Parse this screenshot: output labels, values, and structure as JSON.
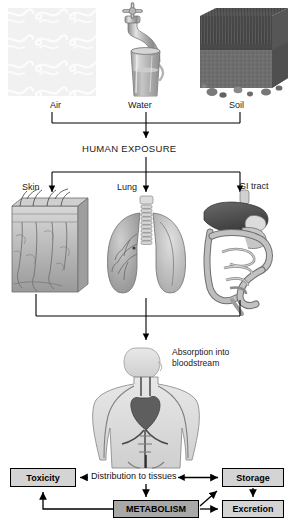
{
  "diagram": {
    "sources": [
      {
        "id": "air",
        "label": "Air",
        "icon": "air-swirls-icon"
      },
      {
        "id": "water",
        "label": "Water",
        "icon": "faucet-glass-icon"
      },
      {
        "id": "soil",
        "label": "Soil",
        "icon": "grass-soil-block-icon"
      }
    ],
    "exposure_node": "HUMAN EXPOSURE",
    "routes": [
      {
        "id": "skin",
        "label": "Skin",
        "icon": "skin-cross-section-icon"
      },
      {
        "id": "lung",
        "label": "Lung",
        "icon": "lungs-icon"
      },
      {
        "id": "gi",
        "label": "GI tract",
        "icon": "gi-tract-icon"
      }
    ],
    "absorption": {
      "label": "Absorption into bloodstream",
      "icon": "human-torso-circulatory-icon"
    },
    "fate": {
      "distribution_label": "Distribution to tissues",
      "boxes": [
        {
          "id": "toxicity",
          "label": "Toxicity"
        },
        {
          "id": "storage",
          "label": "Storage"
        },
        {
          "id": "metabolism",
          "label": "METABOLISM"
        },
        {
          "id": "excretion",
          "label": "Excretion"
        }
      ]
    },
    "colors": {
      "line": "#000000",
      "box_fill": "#d4d4d4",
      "metabolism_fill": "#a8a8a8",
      "background": "#ffffff"
    }
  }
}
